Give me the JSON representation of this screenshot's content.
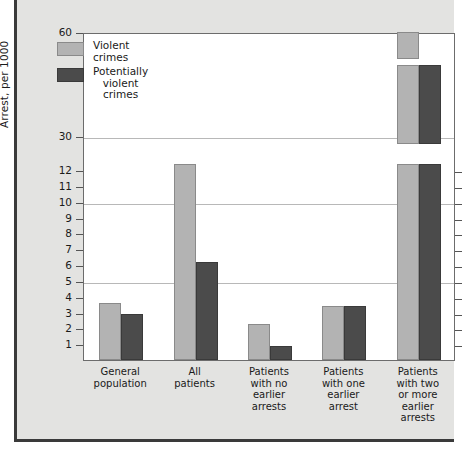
{
  "chart_data": {
    "type": "bar",
    "title": "",
    "xlabel": "",
    "ylabel": "Arrest, per 1000",
    "grid": true,
    "legend_position": "upper-left",
    "axis_note": "broken y-axis: linear 0-12, then compressed breaks to 30 and 60",
    "y_ticks": [
      {
        "label": "60",
        "value": 60
      },
      {
        "label": "30",
        "value": 30
      },
      {
        "label": "12",
        "value": 12
      },
      {
        "label": "11",
        "value": 11
      },
      {
        "label": "10",
        "value": 10
      },
      {
        "label": "9",
        "value": 9
      },
      {
        "label": "8",
        "value": 8
      },
      {
        "label": "7",
        "value": 7
      },
      {
        "label": "6",
        "value": 6
      },
      {
        "label": "5",
        "value": 5
      },
      {
        "label": "4",
        "value": 4
      },
      {
        "label": "3",
        "value": 3
      },
      {
        "label": "2",
        "value": 2
      },
      {
        "label": "1",
        "value": 1
      }
    ],
    "gridline_values": [
      30,
      10,
      5
    ],
    "categories": [
      "General\npopulation",
      "All\npatients",
      "Patients\nwith no\nearlier\narrests",
      "Patients\nwith one\nearlier\narrest",
      "Patients\nwith two\nor more\nearlier\narrests"
    ],
    "series": [
      {
        "name": "Violent crimes",
        "color": "#b3b3b3",
        "values": [
          3.6,
          12.1,
          2.3,
          3.4,
          60.0
        ]
      },
      {
        "name": "Potentially\nviolent crimes",
        "color": "#4b4b4b",
        "values": [
          2.9,
          6.2,
          0.9,
          3.4,
          35.0
        ]
      }
    ]
  },
  "legend": {
    "items": [
      {
        "label": "Violent crimes",
        "swatch": "light"
      },
      {
        "label": "Potentially\nviolent crimes",
        "swatch": "dark"
      }
    ]
  },
  "axis": {
    "y_title": "Arrest, per 1000"
  }
}
